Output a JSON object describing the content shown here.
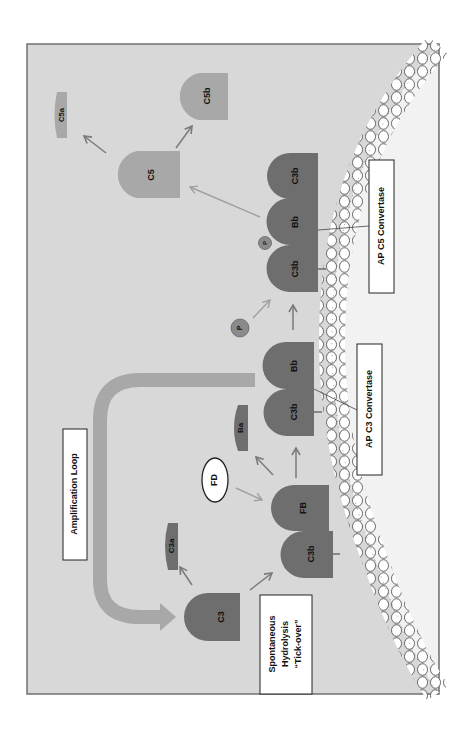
{
  "diagram": {
    "orientation": "rotated-90-ccw",
    "colors": {
      "background": "#d8d8d8",
      "frame": "#707070",
      "dark_protein": "#6e6e6e",
      "light_protein": "#a8a8a8",
      "arrow": "#7a7a7a",
      "light_arrow": "#a0a0a0",
      "membrane": "#ffffff",
      "box": "#ffffff"
    },
    "boxes": {
      "amplification_loop": "Amplification Loop",
      "ap_c3_convertase": "AP C3 Convertase",
      "ap_c5_convertase": "AP C5 Convertase",
      "tick_over_line1": "Spontaneous",
      "tick_over_line2": "Hydrolysis",
      "tick_over_line3": "“Tick-over”"
    },
    "proteins": {
      "c3": "C3",
      "c3a": "C3a",
      "c3b_initial": "C3b",
      "fb": "FB",
      "fd": "FD",
      "ba": "Ba",
      "c3b_conv3": "C3b",
      "bb_conv3": "Bb",
      "p_free": "P",
      "c3b_conv5_a": "C3b",
      "bb_conv5": "Bb",
      "c3b_conv5_b": "C3b",
      "p_bound": "P",
      "c5": "C5",
      "c5a": "C5a",
      "c5b": "C5b"
    }
  }
}
